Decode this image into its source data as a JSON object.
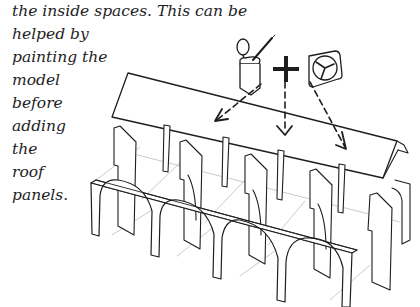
{
  "text": {
    "lines": [
      "the inside spaces. This can be",
      "helped by",
      "painting the",
      "model",
      "before",
      "adding",
      "the",
      "roof",
      "panels."
    ]
  },
  "illustration": {
    "subject": "roof-assembly-diagram",
    "icons": [
      "paint-bottle-with-brush-icon",
      "plus-icon",
      "clock-icon"
    ],
    "arrow_count": 3,
    "arch_count": 4
  },
  "colors": {
    "ink": "#1e1e1e",
    "light_line": "#b8b8b8",
    "background": "#ffffff"
  }
}
